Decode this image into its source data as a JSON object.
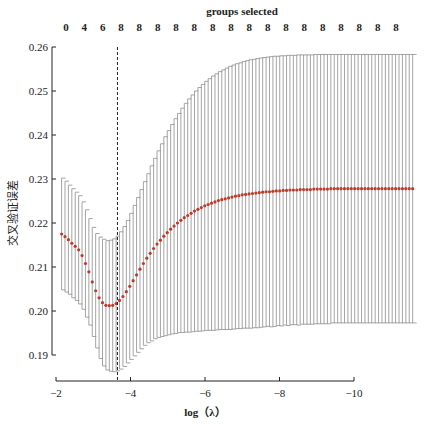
{
  "chart_data": {
    "type": "line",
    "subtype": "errorbar",
    "title": "",
    "top_axis_title": "groups selected",
    "top_tick_labels": [
      "0",
      "4",
      "6",
      "8",
      "8",
      "8",
      "8",
      "8",
      "8",
      "8",
      "8",
      "8",
      "8",
      "8",
      "8",
      "8",
      "8",
      "8",
      "8"
    ],
    "xlabel": "log（λ）",
    "ylabel": "交叉验证误差",
    "x_ticks": [
      -2,
      -4,
      -6,
      -8,
      -10
    ],
    "x_tick_labels": [
      "−2",
      "−4",
      "−6",
      "−8",
      "−10"
    ],
    "xlim": [
      -1.85,
      -10.05
    ],
    "y_ticks": [
      0.19,
      0.2,
      0.21,
      0.22,
      0.23,
      0.24,
      0.25,
      0.26
    ],
    "y_tick_labels": [
      "0.19",
      "0.20",
      "0.21",
      "0.22",
      "0.23",
      "0.24",
      "0.25",
      "0.26"
    ],
    "ylim": [
      0.1865,
      0.2605
    ],
    "grid": false,
    "legend": null,
    "vline": {
      "x": -3.65,
      "style": "dashed",
      "label": "lambda.min"
    },
    "series": [
      {
        "name": "mean",
        "x_start": -2.15,
        "x_step": -0.0915,
        "values": [
          0.2175,
          0.2169,
          0.2162,
          0.2154,
          0.2147,
          0.2139,
          0.2126,
          0.2108,
          0.2089,
          0.2066,
          0.2046,
          0.203,
          0.2019,
          0.2013,
          0.2012,
          0.2013,
          0.2017,
          0.2024,
          0.2033,
          0.2044,
          0.2056,
          0.2069,
          0.2082,
          0.2095,
          0.2108,
          0.212,
          0.2131,
          0.2142,
          0.2152,
          0.2161,
          0.217,
          0.2178,
          0.2186,
          0.2193,
          0.22,
          0.2206,
          0.2212,
          0.2217,
          0.2222,
          0.2227,
          0.2231,
          0.2235,
          0.2239,
          0.2242,
          0.2245,
          0.2248,
          0.2251,
          0.2253,
          0.2255,
          0.2257,
          0.2259,
          0.2261,
          0.2262,
          0.2264,
          0.2265,
          0.2266,
          0.2267,
          0.2268,
          0.2269,
          0.227,
          0.2271,
          0.2271,
          0.2272,
          0.2273,
          0.2273,
          0.2274,
          0.2274,
          0.2275,
          0.2275,
          0.2275,
          0.2276,
          0.2276,
          0.2276,
          0.2276,
          0.2277,
          0.2277,
          0.2277,
          0.2277,
          0.2277,
          0.2278,
          0.2278,
          0.2278,
          0.2278,
          0.2278,
          0.2278,
          0.2278,
          0.2278,
          0.2278,
          0.2278,
          0.2278,
          0.2278,
          0.2278,
          0.2278,
          0.2278,
          0.2278,
          0.2278,
          0.2278,
          0.2278,
          0.2278,
          0.2278,
          0.2278,
          0.2278,
          0.2278,
          0.2278
        ]
      },
      {
        "name": "upper",
        "values": [
          0.2302,
          0.2295,
          0.2286,
          0.2278,
          0.227,
          0.2262,
          0.2248,
          0.223,
          0.221,
          0.219,
          0.2176,
          0.2168,
          0.2163,
          0.216,
          0.2161,
          0.2164,
          0.217,
          0.218,
          0.2192,
          0.2206,
          0.2222,
          0.224,
          0.2258,
          0.2276,
          0.2294,
          0.2312,
          0.233,
          0.2347,
          0.2364,
          0.238,
          0.2396,
          0.241,
          0.2424,
          0.2437,
          0.2449,
          0.2461,
          0.2472,
          0.2482,
          0.2491,
          0.25,
          0.2508,
          0.2515,
          0.2522,
          0.2528,
          0.2534,
          0.2539,
          0.2544,
          0.2548,
          0.2552,
          0.2556,
          0.2559,
          0.2562,
          0.2564,
          0.2567,
          0.2569,
          0.2571,
          0.2572,
          0.2574,
          0.2575,
          0.2576,
          0.2577,
          0.2578,
          0.2579,
          0.2579,
          0.258,
          0.258,
          0.2581,
          0.2581,
          0.2581,
          0.2582,
          0.2582,
          0.2582,
          0.2582,
          0.2582,
          0.2583,
          0.2583,
          0.2583,
          0.2583,
          0.2583,
          0.2583,
          0.2583,
          0.2583,
          0.2583,
          0.2583,
          0.2583,
          0.2583,
          0.2583,
          0.2583,
          0.2583,
          0.2583,
          0.2583,
          0.2583,
          0.2583,
          0.2583,
          0.2583,
          0.2583,
          0.2583,
          0.2583,
          0.2583,
          0.2583,
          0.2583,
          0.2583,
          0.2583,
          0.2583
        ]
      },
      {
        "name": "lower",
        "values": [
          0.2048,
          0.2043,
          0.2038,
          0.203,
          0.2024,
          0.2016,
          0.2004,
          0.1986,
          0.1968,
          0.1942,
          0.1916,
          0.1892,
          0.1875,
          0.1866,
          0.1863,
          0.1862,
          0.1864,
          0.1868,
          0.1874,
          0.1882,
          0.189,
          0.1898,
          0.1906,
          0.1914,
          0.1922,
          0.1928,
          0.1932,
          0.1937,
          0.194,
          0.1942,
          0.1944,
          0.1946,
          0.1948,
          0.1949,
          0.1951,
          0.1951,
          0.1952,
          0.1952,
          0.1953,
          0.1954,
          0.1954,
          0.1955,
          0.1956,
          0.1956,
          0.1956,
          0.1957,
          0.1958,
          0.1958,
          0.1958,
          0.1958,
          0.1959,
          0.196,
          0.196,
          0.1961,
          0.1961,
          0.1961,
          0.1962,
          0.1962,
          0.1963,
          0.1964,
          0.1965,
          0.1964,
          0.1965,
          0.1967,
          0.1966,
          0.1968,
          0.1967,
          0.1969,
          0.1969,
          0.1968,
          0.197,
          0.197,
          0.197,
          0.197,
          0.1971,
          0.1971,
          0.1971,
          0.1971,
          0.1971,
          0.1973,
          0.1973,
          0.1973,
          0.1973,
          0.1973,
          0.1973,
          0.1973,
          0.1973,
          0.1973,
          0.1973,
          0.1973,
          0.1973,
          0.1973,
          0.1973,
          0.1973,
          0.1973,
          0.1973,
          0.1973,
          0.1973,
          0.1973,
          0.1973,
          0.1973,
          0.1973,
          0.1973,
          0.1973
        ]
      }
    ],
    "colors": {
      "points": "#c0392b",
      "errorbars": "#9a9a9a",
      "axes": "#222222",
      "vline": "#222222"
    }
  }
}
